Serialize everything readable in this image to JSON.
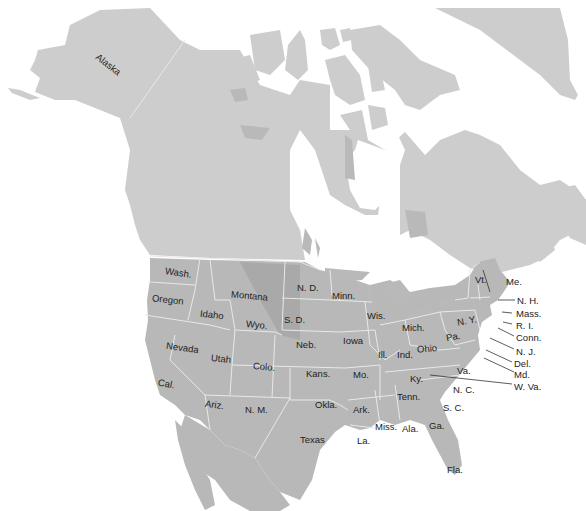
{
  "map": {
    "title": "North America - United States",
    "colors": {
      "land": "#cdcdcd",
      "us_states": "#b8b8b8",
      "water": "#ffffff",
      "border": "#e8e8e8",
      "label": "#222222"
    }
  },
  "labels": {
    "alaska": "Alaska",
    "wash": "Wash.",
    "oregon": "Oregon",
    "idaho": "Idaho",
    "montana": "Montana",
    "wyo": "Wyo.",
    "nd": "N. D.",
    "sd": "S. D.",
    "neb": "Neb.",
    "nevada": "Nevada",
    "utah": "Utah",
    "colo": "Colo.",
    "cal": "Cal.",
    "ariz": "Ariz.",
    "nm": "N. M.",
    "kans": "Kans.",
    "okla": "Okla.",
    "texas": "Texas",
    "minn": "Minn.",
    "iowa": "Iowa",
    "mo": "Mo.",
    "ark": "Ark.",
    "la": "La.",
    "wis": "Wis.",
    "ill": "Ill.",
    "mich": "Mich.",
    "ind": "Ind.",
    "ohio": "Ohio",
    "ky": "Ky.",
    "tenn": "Tenn.",
    "miss": "Miss.",
    "ala": "Ala.",
    "ga": "Ga.",
    "fla": "Fla.",
    "sc": "S. C.",
    "nc": "N. C.",
    "va": "Va.",
    "pa": "Pa.",
    "ny": "N. Y.",
    "vt": "Vt.",
    "me": "Me.",
    "nh": "N. H.",
    "mass": "Mass.",
    "ri": "R. I.",
    "conn": "Conn.",
    "nj": "N. J.",
    "del": "Del.",
    "md": "Md.",
    "wva": "W. Va."
  }
}
